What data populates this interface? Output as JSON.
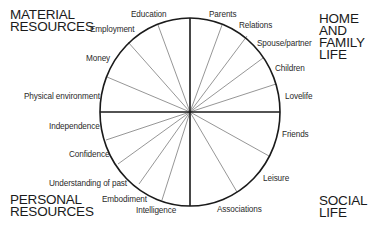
{
  "diagram": {
    "center": [
      190,
      112
    ],
    "rx": 90,
    "ry": 94,
    "colors": {
      "outline": "#1a1a1a",
      "spoke": "#8a8a8a",
      "axis": "#1a1a1a",
      "background": "#ffffff"
    },
    "spokes": [
      [
        158,
        25
      ],
      [
        128,
        42
      ],
      [
        107,
        77
      ],
      [
        222,
        25
      ],
      [
        247,
        36
      ],
      [
        263,
        58
      ],
      [
        276,
        84
      ],
      [
        106,
        140
      ],
      [
        118,
        164
      ],
      [
        139,
        184
      ],
      [
        162,
        200
      ],
      [
        269,
        156
      ],
      [
        237,
        192
      ]
    ]
  },
  "quadrants": {
    "material": {
      "lines": [
        "MATERIAL",
        "RESOURCES"
      ]
    },
    "home": {
      "lines": [
        "HOME",
        "AND",
        "FAMILY",
        "LIFE"
      ]
    },
    "personal": {
      "lines": [
        "PERSONAL",
        "RESOURCES"
      ]
    },
    "social": {
      "lines": [
        "SOCIAL",
        "LIFE"
      ]
    }
  },
  "labels": {
    "education": "Education",
    "employment": "Employment",
    "money": "Money",
    "physical_environment": "Physical environment",
    "parents": "Parents",
    "relations": "Relations",
    "spouse_partner": "Spouse/partner",
    "children": "Children",
    "lovelife": "Lovelife",
    "independence": "Independence",
    "confidence": "Confidence",
    "understanding_of_past": "Understanding of past",
    "embodiment": "Embodiment",
    "intelligence": "Intelligence",
    "friends": "Friends",
    "leisure": "Leisure",
    "associations": "Associations"
  }
}
